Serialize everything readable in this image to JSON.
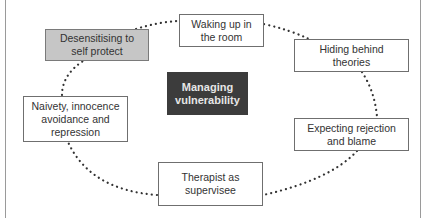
{
  "diagram": {
    "center": {
      "label": "Managing\nvulnerability",
      "fill": "#3c3c3c",
      "text_color": "#e6e6e6"
    },
    "nodes": [
      {
        "id": "waking",
        "label": "Waking up in\nthe room"
      },
      {
        "id": "hiding",
        "label": "Hiding behind\ntheories"
      },
      {
        "id": "expecting",
        "label": "Expecting rejection\nand blame"
      },
      {
        "id": "therapist",
        "label": "Therapist as\nsupervisee"
      },
      {
        "id": "naivety",
        "label": "Naivety, innocence\navoidance and\nrepression"
      },
      {
        "id": "desensitising",
        "label": "Desensitising to\nself protect",
        "fill": "#c6c6c6"
      }
    ],
    "connector_style": "dotted",
    "connector_color": "#333333"
  }
}
